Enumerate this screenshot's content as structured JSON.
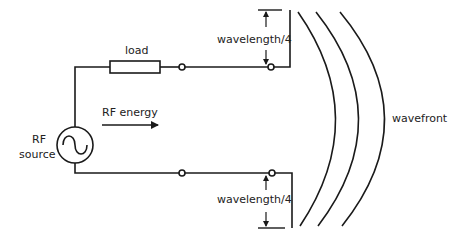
{
  "diagram": {
    "labels": {
      "load": "load",
      "rf_source_line1": "RF",
      "rf_source_line2": "source",
      "rf_energy": "RF energy",
      "wavelength_top": "wavelength/4",
      "wavelength_bottom": "wavelength/4",
      "wavefront": "wavefront"
    },
    "components": [
      {
        "id": "rf-source",
        "type": "ac-source",
        "symbol": "sine-wave"
      },
      {
        "id": "load",
        "type": "resistor"
      },
      {
        "id": "top-antenna-element",
        "type": "quarter-wave-element"
      },
      {
        "id": "bottom-antenna-element",
        "type": "quarter-wave-element"
      },
      {
        "id": "wavefronts",
        "type": "arcs",
        "count": 3
      }
    ],
    "colors": {
      "stroke": "#1a1a1a",
      "text": "#222222",
      "background": "#ffffff"
    }
  }
}
